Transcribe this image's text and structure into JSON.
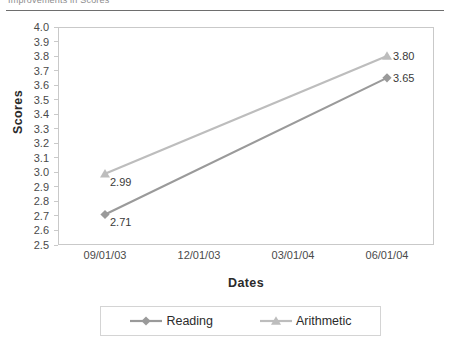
{
  "page": {
    "top_caption": "Improvements in Scores"
  },
  "chart_data": {
    "type": "line",
    "title": "",
    "xlabel": "Dates",
    "ylabel": "Scores",
    "ylim": [
      2.5,
      4.0
    ],
    "ytick_step": 0.1,
    "grid": false,
    "legend_position": "bottom",
    "categories": [
      "09/01/03",
      "12/01/03",
      "03/01/04",
      "06/01/04"
    ],
    "yticks": [
      "4.0",
      "3.9",
      "3.8",
      "3.7",
      "3.6",
      "3.5",
      "3.4",
      "3.3",
      "3.2",
      "3.1",
      "3.0",
      "2.9",
      "2.8",
      "2.7",
      "2.6",
      "2.5"
    ],
    "series": [
      {
        "name": "Reading",
        "marker": "diamond",
        "color": "#9a9a9a",
        "x": [
          "09/01/03",
          "06/01/04"
        ],
        "values": [
          2.71,
          3.65
        ],
        "labels": [
          "2.71",
          "3.65"
        ]
      },
      {
        "name": "Arithmetic",
        "marker": "triangle",
        "color": "#bdbdbd",
        "x": [
          "09/01/03",
          "06/01/04"
        ],
        "values": [
          2.99,
          3.8
        ],
        "labels": [
          "2.99",
          "3.80"
        ]
      }
    ]
  },
  "legend": {
    "items": [
      {
        "label": "Reading",
        "marker": "diamond",
        "color": "#9a9a9a"
      },
      {
        "label": "Arithmetic",
        "marker": "triangle",
        "color": "#bdbdbd"
      }
    ]
  }
}
